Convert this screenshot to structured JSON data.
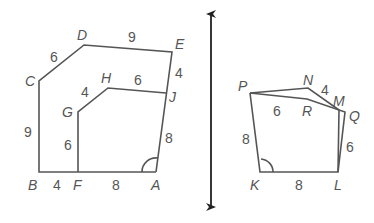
{
  "figure": {
    "left_polygon": {
      "vertices": {
        "A": {
          "label": "A",
          "x": 156,
          "y": 172
        },
        "B": {
          "label": "B",
          "x": 39,
          "y": 172
        },
        "C": {
          "label": "C",
          "x": 39,
          "y": 81
        },
        "D": {
          "label": "D",
          "x": 84,
          "y": 45
        },
        "E": {
          "label": "E",
          "x": 172,
          "y": 52
        },
        "F": {
          "label": "F",
          "x": 78,
          "y": 172
        },
        "G": {
          "label": "G",
          "x": 78,
          "y": 112
        },
        "H": {
          "label": "H",
          "x": 108,
          "y": 88
        },
        "J": {
          "label": "J",
          "x": 166,
          "y": 93
        }
      },
      "side_lengths": {
        "CD": "6",
        "DE": "9",
        "EJ": "4",
        "GH": "4",
        "HJ": "6",
        "JA": "8",
        "BC": "9",
        "FG": "6",
        "BF": "4",
        "FA": "8"
      },
      "angle_mark": "A"
    },
    "right_polygon": {
      "vertices": {
        "K": {
          "label": "K",
          "x": 260,
          "y": 172
        },
        "L": {
          "label": "L",
          "x": 338,
          "y": 172
        },
        "M": {
          "label": "M",
          "x": 339,
          "y": 110
        },
        "N": {
          "label": "N",
          "x": 308,
          "y": 88
        },
        "P": {
          "label": "P",
          "x": 250,
          "y": 93
        },
        "Q": {
          "label": "Q",
          "x": 345,
          "y": 112
        },
        "R": {
          "label": "R",
          "x": 307,
          "y": 99
        }
      },
      "side_lengths": {
        "NM": "4",
        "PR": "6",
        "QL": "6",
        "PK": "8",
        "KL": "8"
      },
      "angle_mark": "K"
    },
    "reflection_line": {
      "x": 211,
      "y_top": 8,
      "y_bottom": 213,
      "arrows": "both"
    }
  }
}
